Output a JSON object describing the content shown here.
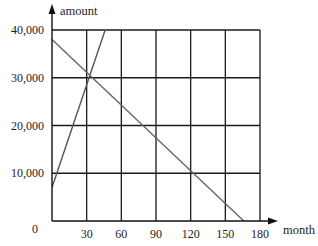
{
  "chart_data": {
    "type": "line",
    "title": "",
    "xlabel": "month",
    "ylabel": "amount",
    "xlim": [
      0,
      180
    ],
    "ylim": [
      0,
      40000
    ],
    "x_ticks": [
      30,
      60,
      90,
      120,
      150,
      180
    ],
    "x_tick_labels": [
      "30",
      "60",
      "90",
      "120",
      "150",
      "180"
    ],
    "y_ticks": [
      0,
      10000,
      20000,
      30000,
      40000
    ],
    "y_tick_labels": [
      "0",
      "10,000",
      "20,000",
      "30,000",
      "40,000"
    ],
    "grid": true,
    "legend": "none",
    "series": [
      {
        "name": "increasing",
        "color": "#555555",
        "points": [
          [
            0,
            7000
          ],
          [
            46,
            40000
          ]
        ]
      },
      {
        "name": "decreasing",
        "color": "#666666",
        "points": [
          [
            0,
            38000
          ],
          [
            166,
            0
          ]
        ]
      }
    ]
  }
}
